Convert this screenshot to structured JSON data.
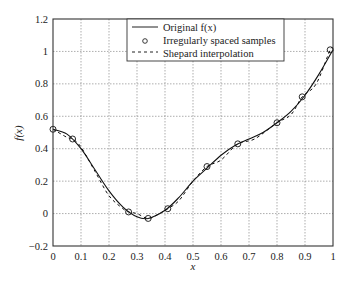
{
  "chart_data": {
    "type": "line",
    "title": "",
    "xlabel": "x",
    "ylabel": "f(x)",
    "xlim": [
      0,
      1
    ],
    "ylim": [
      -0.2,
      1.2
    ],
    "grid": true,
    "legend_position": "upper center",
    "x_ticks": [
      "0",
      "0.1",
      "0.2",
      "0.3",
      "0.4",
      "0.5",
      "0.6",
      "0.7",
      "0.8",
      "0.9",
      "1"
    ],
    "y_ticks": [
      "-0.2",
      "0",
      "0.2",
      "0.4",
      "0.6",
      "0.8",
      "1",
      "1.2"
    ],
    "series": [
      {
        "name": "Original f(x)",
        "style": "solid",
        "x": [
          0,
          0.05,
          0.1,
          0.15,
          0.2,
          0.25,
          0.3,
          0.34,
          0.4,
          0.45,
          0.5,
          0.55,
          0.6,
          0.65,
          0.7,
          0.75,
          0.8,
          0.85,
          0.9,
          0.95,
          1.0
        ],
        "y": [
          0.52,
          0.49,
          0.4,
          0.27,
          0.14,
          0.04,
          -0.02,
          -0.03,
          0.02,
          0.1,
          0.2,
          0.28,
          0.36,
          0.42,
          0.46,
          0.5,
          0.56,
          0.63,
          0.73,
          0.86,
          1.01
        ]
      },
      {
        "name": "Irregularly spaced samples",
        "style": "circle-markers",
        "x": [
          0.0,
          0.07,
          0.27,
          0.34,
          0.41,
          0.55,
          0.66,
          0.8,
          0.89,
          0.99
        ],
        "y": [
          0.52,
          0.46,
          0.01,
          -0.03,
          0.03,
          0.29,
          0.43,
          0.56,
          0.72,
          1.01
        ]
      },
      {
        "name": "Shepard interpolation",
        "style": "dashed",
        "x": [
          0,
          0.05,
          0.07,
          0.1,
          0.15,
          0.2,
          0.25,
          0.27,
          0.3,
          0.34,
          0.38,
          0.41,
          0.45,
          0.5,
          0.55,
          0.6,
          0.66,
          0.72,
          0.8,
          0.85,
          0.89,
          0.94,
          0.99,
          1.0
        ],
        "y": [
          0.52,
          0.47,
          0.46,
          0.41,
          0.26,
          0.11,
          0.03,
          0.01,
          0.0,
          -0.03,
          0.0,
          0.03,
          0.08,
          0.2,
          0.29,
          0.33,
          0.43,
          0.46,
          0.56,
          0.61,
          0.72,
          0.8,
          1.01,
          1.01
        ]
      }
    ]
  },
  "legend": {
    "items": [
      {
        "label": "Original f(x)",
        "style": "solid"
      },
      {
        "label": "Irregularly spaced samples",
        "style": "circle"
      },
      {
        "label": "Shepard interpolation",
        "style": "dashed"
      }
    ]
  },
  "labels": {
    "xlabel": "x",
    "ylabel": "f(x)"
  }
}
